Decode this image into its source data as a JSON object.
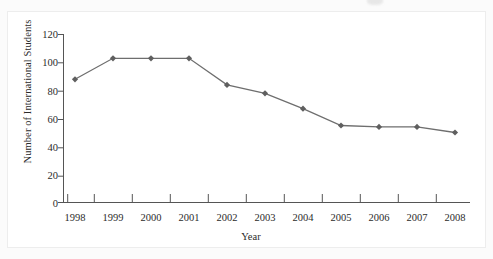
{
  "chart_data": {
    "type": "line",
    "title": "",
    "xlabel": "Year",
    "ylabel": "Number of International Students",
    "categories": [
      "1998",
      "1999",
      "2000",
      "2001",
      "2002",
      "2003",
      "2004",
      "2005",
      "2006",
      "2007",
      "2008"
    ],
    "values": [
      88,
      103,
      103,
      103,
      84,
      78,
      67,
      55,
      54,
      54,
      50
    ],
    "series": [
      {
        "name": "Number of International Students",
        "values": [
          88,
          103,
          103,
          103,
          84,
          78,
          67,
          55,
          54,
          54,
          50
        ]
      }
    ],
    "ylim": [
      0,
      120
    ],
    "yticks": [
      0,
      20,
      40,
      60,
      80,
      100,
      120
    ],
    "ytick_labels": [
      "0",
      "20",
      "40",
      "60",
      "80",
      "100",
      "120"
    ],
    "xtick_labels": [
      "1998",
      "1999",
      "2000",
      "2001",
      "2002",
      "2003",
      "2004",
      "2005",
      "2006",
      "2007",
      "2008"
    ],
    "grid": false,
    "legend": false,
    "legend_position": "none",
    "marker": "diamond",
    "line_color": "#6e6e6e",
    "marker_color": "#5f5f5f",
    "axis_color": "#555555",
    "text_color": "#2b2b2b"
  },
  "axes": {
    "y_title": "Number of International Students",
    "x_title": "Year"
  }
}
